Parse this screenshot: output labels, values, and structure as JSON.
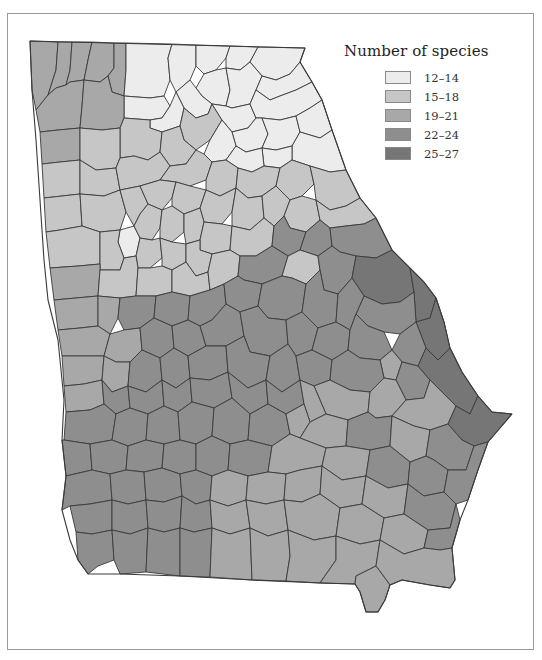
{
  "legend": {
    "title": "Number of species",
    "classes": [
      {
        "label": "12–14",
        "color": "#ececec"
      },
      {
        "label": "15–18",
        "color": "#c6c6c6"
      },
      {
        "label": "19–21",
        "color": "#a8a8a8"
      },
      {
        "label": "22–24",
        "color": "#8e8e8e"
      },
      {
        "label": "25–27",
        "color": "#767676"
      }
    ]
  },
  "map": {
    "region": "Georgia counties",
    "outline": "30,41 305,48 300,62 312,82 322,100 332,130 346,170 360,198 376,218 392,250 410,268 424,282 436,298 444,322 450,348 462,372 478,396 492,412 512,414 500,428 488,442 478,470 468,500 460,520 452,548 455,580 450,588 430,585 402,580 390,585 385,600 378,612 366,612 360,592 355,584 320,583 252,580 180,576 120,574 88,574 78,560 70,540 62,510 66,476 62,440 64,400 60,360 58,340 48,300 44,260 40,200 36,140 32,90",
    "counties": [
      {
        "c": 2,
        "p": "30,41 58,42 56,70 48,95 36,110 32,90"
      },
      {
        "c": 2,
        "p": "58,42 72,42 70,70 66,85 56,88 48,95 56,70"
      },
      {
        "c": 2,
        "p": "72,42 92,42 88,60 84,80 70,82 66,85 70,70"
      },
      {
        "c": 2,
        "p": "92,42 114,43 114,68 108,76 100,82 84,80 88,60"
      },
      {
        "c": 2,
        "p": "114,43 126,43 126,70 124,96 112,92 108,76 114,68"
      },
      {
        "c": 0,
        "p": "126,43 172,44 168,58 170,80 164,96 150,98 124,96 126,70"
      },
      {
        "c": 0,
        "p": "172,44 196,45 196,66 190,80 176,92 170,80 168,58"
      },
      {
        "c": 0,
        "p": "196,45 230,46 226,58 216,70 204,74 196,66"
      },
      {
        "c": 0,
        "p": "230,46 258,47 250,62 240,70 226,68 226,58"
      },
      {
        "c": 0,
        "p": "258,47 305,48 300,62 290,74 276,80 262,76 250,62"
      },
      {
        "c": 0,
        "p": "204,74 216,70 226,68 230,90 226,106 212,104 202,96 196,88"
      },
      {
        "c": 0,
        "p": "226,68 240,70 250,62 262,76 256,90 250,104 232,108 226,106 230,90"
      },
      {
        "c": 0,
        "p": "262,76 276,80 290,74 300,62 312,82 296,90 280,96 270,100 256,90"
      },
      {
        "c": 0,
        "p": "176,92 190,80 196,88 202,96 212,104 208,114 196,118 184,108"
      },
      {
        "c": 0,
        "p": "124,96 150,98 164,96 170,106 162,118 150,120 124,118"
      },
      {
        "c": 0,
        "p": "150,120 162,118 170,106 176,92 184,108 180,126 162,132 150,128"
      },
      {
        "c": 1,
        "p": "184,108 196,118 208,114 212,104 222,120 210,140 196,150 184,140 180,126"
      },
      {
        "c": 0,
        "p": "212,104 226,106 232,108 250,104 256,118 248,128 232,132 222,120"
      },
      {
        "c": 0,
        "p": "256,90 270,100 280,96 296,90 312,82 322,100 310,108 296,116 280,120 262,118 256,118 250,104"
      },
      {
        "c": 0,
        "p": "232,132 248,128 256,118 262,118 268,134 262,148 246,152 236,146"
      },
      {
        "c": 0,
        "p": "262,118 280,120 296,116 300,132 292,146 276,150 262,148 268,134"
      },
      {
        "c": 0,
        "p": "296,116 310,108 322,100 332,130 320,138 300,132"
      },
      {
        "c": 0,
        "p": "300,132 320,138 332,130 346,170 330,172 310,166 292,160 292,146"
      },
      {
        "c": 0,
        "p": "262,148 276,150 292,146 292,160 280,168 264,166"
      },
      {
        "c": 0,
        "p": "210,140 222,120 232,132 236,146 226,160 212,162 204,154"
      },
      {
        "c": 0,
        "p": "236,146 246,152 262,148 264,166 252,172 238,168 226,160"
      },
      {
        "c": 2,
        "p": "36,110 48,95 56,88 66,85 70,82 84,80 82,106 80,128 58,130 40,132"
      },
      {
        "c": 2,
        "p": "84,80 100,82 108,76 112,92 124,96 124,118 120,128 102,130 80,128 82,106"
      },
      {
        "c": 1,
        "p": "124,118 150,120 150,128 162,132 160,152 148,160 134,156 120,158 120,128"
      },
      {
        "c": 2,
        "p": "40,132 58,130 80,128 80,160 60,162 42,164"
      },
      {
        "c": 1,
        "p": "80,128 102,130 120,128 120,158 116,168 96,170 80,160"
      },
      {
        "c": 1,
        "p": "162,132 180,126 184,140 196,150 186,164 170,166 160,152"
      },
      {
        "c": 1,
        "p": "42,164 60,162 80,160 80,194 62,196 44,198"
      },
      {
        "c": 1,
        "p": "80,160 96,170 116,168 120,190 104,196 80,194"
      },
      {
        "c": 1,
        "p": "116,168 120,158 134,156 148,160 160,152 170,166 160,180 140,186 120,190"
      },
      {
        "c": 1,
        "p": "170,166 186,164 196,150 204,154 212,162 206,180 190,186 176,182 160,180"
      },
      {
        "c": 1,
        "p": "212,162 226,160 238,168 236,188 220,196 206,190 206,180"
      },
      {
        "c": 1,
        "p": "238,168 252,172 264,166 280,168 276,186 262,196 248,198 236,188"
      },
      {
        "c": 1,
        "p": "280,168 292,160 310,166 314,184 302,196 290,200 276,186"
      },
      {
        "c": 1,
        "p": "310,166 330,172 346,170 360,198 346,206 330,210 316,200 314,184"
      },
      {
        "c": 1,
        "p": "44,198 62,196 80,194 82,226 60,230 46,232"
      },
      {
        "c": 1,
        "p": "80,194 104,196 120,190 126,212 120,230 100,232 82,226"
      },
      {
        "c": 1,
        "p": "120,190 140,186 148,204 140,214 134,226 126,212"
      },
      {
        "c": 1,
        "p": "140,186 160,180 176,182 172,198 162,210 148,204"
      },
      {
        "c": 1,
        "p": "176,182 190,186 206,190 200,208 184,214 172,206 172,198"
      },
      {
        "c": 1,
        "p": "206,190 220,196 236,188 232,212 222,224 204,222 200,208"
      },
      {
        "c": 1,
        "p": "236,188 248,198 262,196 264,218 250,230 232,226 232,212"
      },
      {
        "c": 1,
        "p": "262,196 276,186 290,200 284,216 274,226 264,218"
      },
      {
        "c": 1,
        "p": "290,200 302,196 316,200 320,220 306,232 290,228 284,216"
      },
      {
        "c": 1,
        "p": "316,200 330,210 346,206 360,198 376,218 364,224 346,226 330,228 320,220"
      },
      {
        "c": 0,
        "p": "120,230 134,226 140,238 136,256 124,258 118,242"
      },
      {
        "c": 1,
        "p": "134,226 140,214 148,204 162,210 160,228 152,240 140,238"
      },
      {
        "c": 1,
        "p": "162,210 172,206 184,214 184,232 172,242 160,238 160,228"
      },
      {
        "c": 1,
        "p": "184,214 200,208 204,222 200,240 186,244 184,232"
      },
      {
        "c": 1,
        "p": "204,222 222,224 232,226 230,250 212,254 200,250 200,240"
      },
      {
        "c": 1,
        "p": "46,232 60,230 82,226 100,232 100,264 78,266 50,268"
      },
      {
        "c": 1,
        "p": "100,232 120,230 118,242 124,258 120,270 100,270 100,264"
      },
      {
        "c": 1,
        "p": "136,256 140,238 152,240 160,238 162,258 150,268 138,268"
      },
      {
        "c": 1,
        "p": "160,238 172,242 186,244 186,262 172,270 162,266 162,258"
      },
      {
        "c": 1,
        "p": "186,244 200,240 200,250 212,254 208,272 196,276 186,262"
      },
      {
        "c": 1,
        "p": "232,226 250,230 264,218 274,226 272,246 256,256 240,256 230,250"
      },
      {
        "c": 3,
        "p": "274,226 284,216 290,228 306,232 300,250 288,256 272,246"
      },
      {
        "c": 3,
        "p": "306,232 320,220 330,228 332,246 318,256 300,250"
      },
      {
        "c": 3,
        "p": "330,228 346,226 364,224 376,218 392,250 376,258 356,256 340,252 332,246"
      },
      {
        "c": 2,
        "p": "50,268 78,266 100,264 100,270 98,296 76,298 54,300"
      },
      {
        "c": 1,
        "p": "100,270 120,270 124,258 136,256 138,268 136,296 120,298 98,296"
      },
      {
        "c": 1,
        "p": "138,268 150,268 162,266 172,270 172,292 156,296 136,296"
      },
      {
        "c": 1,
        "p": "172,270 186,262 196,276 208,272 210,290 190,296 172,292"
      },
      {
        "c": 1,
        "p": "208,272 212,254 230,250 240,256 238,276 224,284 210,290"
      },
      {
        "c": 3,
        "p": "240,256 256,256 272,246 288,256 282,276 262,284 244,280 238,276"
      },
      {
        "c": 1,
        "p": "288,256 300,250 318,256 320,270 306,284 292,278 282,276"
      },
      {
        "c": 3,
        "p": "318,256 332,246 340,252 356,256 352,278 338,294 324,290 320,270"
      },
      {
        "c": 4,
        "p": "356,256 376,258 392,250 410,268 414,292 400,302 382,304 364,296 352,278"
      },
      {
        "c": 2,
        "p": "54,300 76,298 98,296 98,326 80,328 58,330"
      },
      {
        "c": 2,
        "p": "98,296 120,298 118,318 110,334 98,326"
      },
      {
        "c": 3,
        "p": "120,298 136,296 156,296 154,318 140,328 124,330 118,318"
      },
      {
        "c": 3,
        "p": "156,296 172,292 190,296 188,320 172,326 154,318"
      },
      {
        "c": 3,
        "p": "190,296 210,290 224,284 226,304 212,320 200,326 188,320"
      },
      {
        "c": 3,
        "p": "224,284 238,276 244,280 262,284 258,306 240,312 226,304"
      },
      {
        "c": 3,
        "p": "262,284 282,276 292,278 306,284 302,312 286,320 268,318 258,306"
      },
      {
        "c": 3,
        "p": "306,284 320,270 324,290 338,294 336,322 318,328 302,312"
      },
      {
        "c": 4,
        "p": "410,268 424,282 436,298 430,318 416,322 414,292"
      },
      {
        "c": 3,
        "p": "364,296 382,304 400,302 414,292 416,322 400,334 384,332 368,326 356,314"
      },
      {
        "c": 3,
        "p": "338,294 352,278 364,296 356,314 350,330 336,322"
      },
      {
        "c": 2,
        "p": "58,330 80,328 98,326 110,334 104,356 84,356 62,356"
      },
      {
        "c": 2,
        "p": "110,334 124,330 140,328 142,350 130,362 116,362 104,356"
      },
      {
        "c": 3,
        "p": "140,328 154,318 172,326 174,348 160,358 142,350"
      },
      {
        "c": 3,
        "p": "172,326 188,320 200,326 206,346 188,356 174,348"
      },
      {
        "c": 3,
        "p": "200,326 212,320 226,304 240,312 244,336 226,346 206,346"
      },
      {
        "c": 3,
        "p": "240,312 258,306 268,318 286,320 288,344 270,356 250,352 244,336"
      },
      {
        "c": 3,
        "p": "286,320 302,312 318,328 312,350 296,356 288,344"
      },
      {
        "c": 3,
        "p": "318,328 336,322 350,330 348,350 332,360 312,350"
      },
      {
        "c": 4,
        "p": "430,318 436,298 444,322 450,348 438,360 426,348 416,322"
      },
      {
        "c": 3,
        "p": "400,334 416,322 426,348 418,366 402,362 392,350"
      },
      {
        "c": 3,
        "p": "350,330 356,314 368,326 384,332 392,350 380,360 360,358 348,350"
      },
      {
        "c": 2,
        "p": "62,356 84,356 104,356 102,380 84,384 64,386"
      },
      {
        "c": 2,
        "p": "104,356 116,362 130,362 128,386 112,392 102,380"
      },
      {
        "c": 3,
        "p": "130,362 142,350 160,358 162,380 146,392 128,386"
      },
      {
        "c": 3,
        "p": "160,358 174,348 188,356 190,378 176,388 162,380"
      },
      {
        "c": 3,
        "p": "188,356 206,346 226,346 228,372 210,380 190,378"
      },
      {
        "c": 3,
        "p": "226,346 244,336 250,352 270,356 266,380 248,388 228,372"
      },
      {
        "c": 3,
        "p": "270,356 288,344 296,356 300,380 282,392 266,380"
      },
      {
        "c": 3,
        "p": "296,356 312,350 332,360 330,380 314,386 300,380"
      },
      {
        "c": 2,
        "p": "380,360 392,350 402,362 396,380 384,378"
      },
      {
        "c": 3,
        "p": "332,360 348,350 360,358 380,360 384,378 370,392 350,390 330,380"
      },
      {
        "c": 3,
        "p": "402,362 418,366 430,380 424,398 406,400 396,380"
      },
      {
        "c": 4,
        "p": "438,360 450,348 462,372 478,396 470,414 456,406 440,390 430,380 418,366 426,348"
      },
      {
        "c": 2,
        "p": "64,386 84,384 102,380 104,404 90,410 66,412"
      },
      {
        "c": 3,
        "p": "102,380 112,392 128,386 130,408 116,414 104,404"
      },
      {
        "c": 3,
        "p": "128,386 146,392 162,380 164,406 148,414 130,408"
      },
      {
        "c": 3,
        "p": "162,380 176,388 190,378 192,402 178,412 164,406"
      },
      {
        "c": 3,
        "p": "190,378 210,380 228,372 232,398 214,408 192,402"
      },
      {
        "c": 3,
        "p": "228,372 248,388 266,380 268,404 250,414 232,398"
      },
      {
        "c": 3,
        "p": "266,380 282,392 300,380 304,404 286,414 268,404"
      },
      {
        "c": 2,
        "p": "330,380 350,390 370,392 368,412 348,420 326,414 314,386"
      },
      {
        "c": 2,
        "p": "300,380 314,386 326,414 310,422 304,404"
      },
      {
        "c": 2,
        "p": "370,392 384,378 396,380 406,400 392,416 376,418 368,412"
      },
      {
        "c": 2,
        "p": "406,400 424,398 430,380 440,390 456,406 448,424 430,430 414,426 392,416"
      },
      {
        "c": 4,
        "p": "456,406 470,414 478,396 492,412 512,414 500,428 488,442 474,446 462,440 448,424"
      },
      {
        "c": 3,
        "p": "66,412 90,410 104,404 116,414 112,440 90,444 64,440"
      },
      {
        "c": 3,
        "p": "116,414 130,408 148,414 146,440 128,446 112,440"
      },
      {
        "c": 3,
        "p": "148,414 164,406 178,412 180,440 164,444 146,440"
      },
      {
        "c": 3,
        "p": "178,412 192,402 214,408 212,436 196,444 180,440"
      },
      {
        "c": 3,
        "p": "214,408 232,398 250,414 248,440 230,444 212,436"
      },
      {
        "c": 3,
        "p": "250,414 268,404 286,414 290,434 272,446 248,440"
      },
      {
        "c": 2,
        "p": "286,414 304,404 310,422 300,438 290,434"
      },
      {
        "c": 2,
        "p": "310,422 326,414 348,420 346,446 326,448 300,438"
      },
      {
        "c": 3,
        "p": "348,420 368,412 376,418 392,416 390,446 370,450 346,446"
      },
      {
        "c": 2,
        "p": "392,416 414,426 430,430 426,456 410,462 390,446"
      },
      {
        "c": 3,
        "p": "430,430 448,424 462,440 474,446 466,470 448,470 434,460 426,456"
      },
      {
        "c": 3,
        "p": "62,440 64,440 90,444 92,470 66,476"
      },
      {
        "c": 3,
        "p": "90,444 112,440 128,446 126,470 110,474 92,470"
      },
      {
        "c": 3,
        "p": "128,446 146,440 164,444 162,468 144,472 126,470"
      },
      {
        "c": 3,
        "p": "164,444 180,440 196,444 196,470 180,474 162,468"
      },
      {
        "c": 3,
        "p": "196,444 212,436 230,444 228,470 212,476 196,470"
      },
      {
        "c": 3,
        "p": "230,444 248,440 272,446 268,472 248,476 228,470"
      },
      {
        "c": 2,
        "p": "272,446 290,434 300,438 326,448 322,466 300,470 286,474 268,472"
      },
      {
        "c": 2,
        "p": "326,448 346,446 370,450 366,476 342,480 322,466"
      },
      {
        "c": 3,
        "p": "370,450 390,446 410,462 408,484 388,488 366,476"
      },
      {
        "c": 3,
        "p": "410,462 426,456 434,460 448,470 444,492 424,496 408,484"
      },
      {
        "c": 3,
        "p": "448,470 466,470 474,446 488,442 478,470 468,500 456,504 444,492"
      },
      {
        "c": 3,
        "p": "66,476 92,470 110,474 112,500 90,504 70,506 62,510"
      },
      {
        "c": 3,
        "p": "110,474 126,470 144,472 146,500 128,504 112,500"
      },
      {
        "c": 3,
        "p": "144,472 162,468 180,474 182,496 164,502 146,500"
      },
      {
        "c": 3,
        "p": "180,474 196,470 212,476 210,500 196,504 182,496"
      },
      {
        "c": 2,
        "p": "212,476 228,470 248,476 246,500 228,506 210,500"
      },
      {
        "c": 2,
        "p": "248,476 268,472 286,474 284,500 266,504 246,500"
      },
      {
        "c": 2,
        "p": "286,474 300,470 322,466 320,494 302,502 284,500"
      },
      {
        "c": 2,
        "p": "322,466 342,480 366,476 362,504 340,508 320,494"
      },
      {
        "c": 2,
        "p": "366,476 388,488 408,484 404,514 384,518 362,504"
      },
      {
        "c": 3,
        "p": "408,484 424,496 444,492 456,504 450,528 428,530 404,514"
      },
      {
        "c": 3,
        "p": "70,506 90,504 112,500 112,530 92,534 76,532"
      },
      {
        "c": 3,
        "p": "112,500 128,504 146,500 148,528 130,534 112,530"
      },
      {
        "c": 3,
        "p": "146,500 164,502 182,496 180,528 164,532 148,528"
      },
      {
        "c": 3,
        "p": "182,496 196,504 210,500 212,528 194,532 180,528"
      },
      {
        "c": 2,
        "p": "210,500 228,506 246,500 250,528 230,534 212,528"
      },
      {
        "c": 2,
        "p": "246,500 266,504 284,500 288,530 268,536 250,528"
      },
      {
        "c": 2,
        "p": "284,500 302,502 320,494 340,508 336,536 314,540 288,530"
      },
      {
        "c": 2,
        "p": "340,508 362,504 384,518 380,540 360,544 336,536"
      },
      {
        "c": 2,
        "p": "384,518 404,514 428,530 424,548 404,554 380,540"
      },
      {
        "c": 3,
        "p": "428,530 450,528 456,504 460,520 452,548 440,550 424,548"
      },
      {
        "c": 3,
        "p": "76,532 92,534 112,530 114,560 98,566 88,574 78,560"
      },
      {
        "c": 3,
        "p": "112,530 130,534 148,528 146,572 120,574 114,560"
      },
      {
        "c": 3,
        "p": "148,528 164,532 180,528 180,576 146,572"
      },
      {
        "c": 3,
        "p": "180,528 194,532 212,528 210,577 180,576"
      },
      {
        "c": 2,
        "p": "212,528 230,534 250,528 252,580 210,577"
      },
      {
        "c": 2,
        "p": "250,528 268,536 288,530 290,556 286,581 252,580"
      },
      {
        "c": 2,
        "p": "288,530 314,540 336,536 336,560 320,583 286,581 290,556"
      },
      {
        "c": 2,
        "p": "336,536 360,544 380,540 376,566 356,576 355,584 320,583 336,560"
      },
      {
        "c": 2,
        "p": "380,540 404,554 424,548 440,550 452,548 455,580 450,588 430,585 402,580 390,585 376,566"
      },
      {
        "c": 2,
        "p": "356,576 376,566 390,585 385,600 378,612 366,612 360,592 355,584"
      }
    ]
  }
}
